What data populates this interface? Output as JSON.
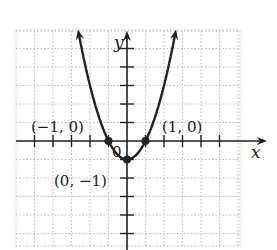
{
  "chart_data": {
    "type": "line",
    "title": "",
    "function": "y = x^2 - 1",
    "xlabel": "x",
    "ylabel": "y",
    "xlim": [
      -6,
      6
    ],
    "ylim": [
      -5.5,
      6
    ],
    "grid": true,
    "origin_label": "0",
    "series": [
      {
        "name": "parabola",
        "x": [
          -2.65,
          -2,
          -1.5,
          -1,
          -0.5,
          0,
          0.5,
          1,
          1.5,
          2,
          2.65
        ],
        "y": [
          6.0,
          3,
          1.25,
          0,
          -0.75,
          -1,
          -0.75,
          0,
          1.25,
          3,
          6.0
        ]
      }
    ],
    "points": [
      {
        "x": -1,
        "y": 0,
        "label": "(−1, 0)"
      },
      {
        "x": 1,
        "y": 0,
        "label": "(1, 0)"
      },
      {
        "x": 0,
        "y": -1,
        "label": "(0, −1)"
      }
    ],
    "colors": {
      "curve": "#222222",
      "grid": "#bbbbbb",
      "axis": "#222222"
    }
  },
  "labels": {
    "x_axis": "x",
    "y_axis": "y",
    "origin": "0",
    "point_left": "(−1, 0)",
    "point_right": "(1, 0)",
    "point_vertex": "(0, −1)"
  }
}
